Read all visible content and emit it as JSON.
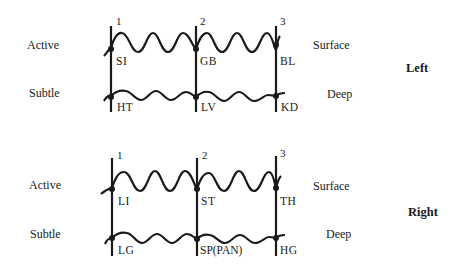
{
  "panels": [
    {
      "side_label": "Left",
      "row_labels": {
        "top_left": "Active",
        "bottom_left": "Subtle",
        "top_right": "Surface",
        "bottom_right": "Deep"
      },
      "columns": [
        "1",
        "2",
        "3"
      ],
      "top_points": [
        "SI",
        "GB",
        "BL"
      ],
      "bottom_points": [
        "HT",
        "LV",
        "KD"
      ]
    },
    {
      "side_label": "Right",
      "row_labels": {
        "top_left": "Active",
        "bottom_left": "Subtle",
        "top_right": "Surface",
        "bottom_right": "Deep"
      },
      "columns": [
        "1",
        "2",
        "3"
      ],
      "top_points": [
        "LI",
        "ST",
        "TH"
      ],
      "bottom_points": [
        "LG",
        "SP(PAN)",
        "HG"
      ]
    }
  ],
  "colors": {
    "line": "#1a1a1a",
    "background": "#ffffff"
  }
}
